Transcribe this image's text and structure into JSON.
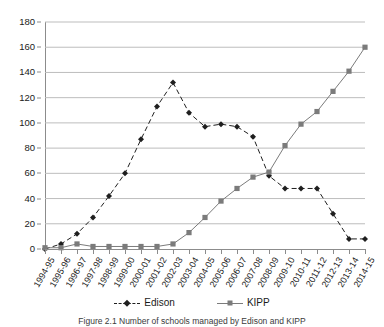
{
  "chart_data": {
    "type": "line",
    "title": "",
    "xlabel": "",
    "ylabel": "",
    "ylim": [
      0,
      180
    ],
    "y_ticks": [
      0,
      20,
      40,
      60,
      80,
      100,
      120,
      140,
      160,
      180
    ],
    "grid": "horizontal",
    "legend_position": "bottom",
    "categories": [
      "1994-95",
      "1995-96",
      "1996-97",
      "1997-98",
      "1998-99",
      "1999-00",
      "2000-01",
      "2001-02",
      "2002-03",
      "2003-04",
      "2004-05",
      "2005-06",
      "2006-07",
      "2007-08",
      "2008-09",
      "2009-10",
      "2010-11",
      "2011-12",
      "2012-13",
      "2013-14",
      "2014-15"
    ],
    "series": [
      {
        "name": "Edison",
        "color": "#1f1f1f",
        "marker": "diamond",
        "line_style": "dashed",
        "values": [
          0,
          4,
          12,
          25,
          42,
          60,
          87,
          113,
          132,
          108,
          97,
          99,
          97,
          89,
          58,
          48,
          48,
          48,
          28,
          8,
          8
        ]
      },
      {
        "name": "KIPP",
        "color": "#7b7b7b",
        "marker": "square",
        "line_style": "solid",
        "values": [
          1,
          1,
          4,
          2,
          2,
          2,
          2,
          2,
          4,
          13,
          25,
          38,
          48,
          57,
          61,
          82,
          99,
          109,
          125,
          141,
          160
        ]
      }
    ]
  },
  "legend": {
    "entries": [
      {
        "label": "Edison"
      },
      {
        "label": "KIPP"
      }
    ]
  },
  "caption": {
    "text": "Figure 2.1 Number of schools managed by Edison and KIPP"
  }
}
